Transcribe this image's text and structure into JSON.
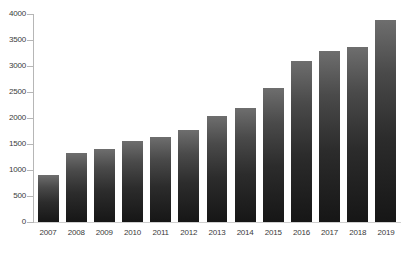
{
  "chart_data": {
    "type": "bar",
    "title": "",
    "subtitle": "",
    "xlabel": "",
    "ylabel": "",
    "categories": [
      "2007",
      "2008",
      "2009",
      "2010",
      "2011",
      "2012",
      "2013",
      "2014",
      "2015",
      "2016",
      "2017",
      "2018",
      "2019"
    ],
    "values": [
      910,
      1330,
      1410,
      1560,
      1630,
      1760,
      2030,
      2200,
      2575,
      3090,
      3290,
      3360,
      3890
    ],
    "series": [
      {
        "name": "",
        "values": [
          910,
          1330,
          1410,
          1560,
          1630,
          1760,
          2030,
          2200,
          2575,
          3090,
          3290,
          3360,
          3890
        ]
      }
    ],
    "ylim": [
      0,
      4000
    ],
    "y_ticks": [
      0,
      500,
      1000,
      1500,
      2000,
      2500,
      3000,
      3500,
      4000
    ],
    "y_tick_labels": [
      "0",
      "500",
      "1000",
      "1500",
      "2000",
      "2500",
      "3000",
      "3500",
      "4000"
    ],
    "grid": false,
    "legend": null,
    "legend_position": "none",
    "annotations": [],
    "colors": {
      "bar_top": "#6e6e6e",
      "bar_bottom": "#161616",
      "axis_line": "#b6b6b6",
      "baseline": "#cfcfcf",
      "tick_label": "#3b3b3b",
      "background": "#ffffff"
    }
  }
}
